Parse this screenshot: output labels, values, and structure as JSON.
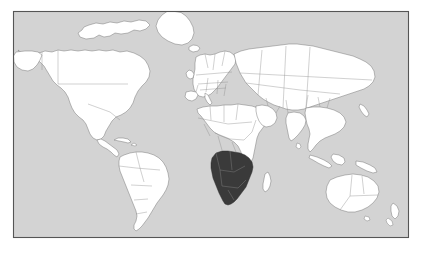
{
  "figure": {
    "type": "locator-map",
    "projection": "equirectangular-world",
    "width": 422,
    "height": 262
  },
  "frame": {
    "x": 13,
    "y": 11,
    "width": 396,
    "height": 227,
    "stroke_color": "#555555",
    "page_background": "#ffffff"
  },
  "colors": {
    "ocean": "#d3d3d3",
    "land_fill": "#ffffff",
    "land_stroke": "#6e6e6e",
    "internal_border": "#8a8a8a",
    "highlight_fill": "#3a3a3a",
    "highlight_stroke": "#2a2a2a"
  },
  "legend": {
    "visible": false,
    "highlight_meaning": "Highlighted countries (Southern Africa)"
  },
  "labels": {
    "visible": false,
    "text_items": []
  },
  "highlighted_region": {
    "name": "Southern Africa",
    "countries": [
      "Angola",
      "Zambia",
      "Zimbabwe",
      "Namibia",
      "Botswana",
      "Mozambique",
      "South Africa",
      "Lesotho",
      "Eswatini",
      "Malawi"
    ]
  },
  "continents": [
    "North America",
    "South America",
    "Europe",
    "Africa",
    "Asia",
    "Oceania"
  ],
  "notable_features": [
    "Greenland",
    "Canadian Arctic Archipelago",
    "Alaska",
    "Madagascar",
    "Japan",
    "Indonesia",
    "Australia",
    "New Zealand",
    "Tasmania",
    "Sri Lanka",
    "Iceland",
    "British Isles"
  ]
}
